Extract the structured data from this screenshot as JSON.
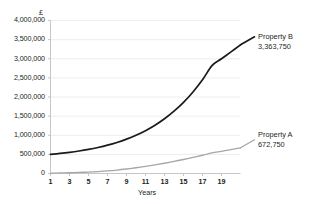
{
  "chart_data": {
    "type": "line",
    "title": "",
    "xlabel": "Years",
    "ylabel": "£",
    "currency_symbol": "£",
    "x": [
      1,
      2,
      3,
      4,
      5,
      6,
      7,
      8,
      9,
      10,
      11,
      12,
      13,
      14,
      15,
      16,
      17,
      18,
      19,
      20,
      21
    ],
    "xtick_labels": [
      "1",
      "3",
      "5",
      "7",
      "9",
      "11",
      "13",
      "15",
      "17",
      "19"
    ],
    "xtick_values": [
      1,
      3,
      5,
      7,
      9,
      11,
      13,
      15,
      17,
      19
    ],
    "xlim": [
      1,
      21
    ],
    "ylim": [
      0,
      4000000
    ],
    "ytick_labels": [
      "0",
      "500,000",
      "1,000,000",
      "1,500,000",
      "2,000,000",
      "2,500,000",
      "3,000,000",
      "3,500,000",
      "4,000,000"
    ],
    "ytick_values": [
      0,
      500000,
      1000000,
      1500000,
      2000000,
      2500000,
      3000000,
      3500000,
      4000000
    ],
    "grid": "horizontal",
    "legend_position": "inline-right-annotations",
    "series": [
      {
        "name": "Property B",
        "end_label": "3,363,750",
        "end_value": 3363750,
        "color": "#1a1a1a",
        "values": [
          500000,
          524000,
          553000,
          588000,
          630000,
          680000,
          740000,
          812000,
          898000,
          1000000,
          1120000,
          1262000,
          1430000,
          1628000,
          1860000,
          2132000,
          2450000,
          2820000,
          3000000,
          3180000,
          3363750
        ]
      },
      {
        "name": "Property A",
        "end_label": "672,750",
        "end_value": 672750,
        "color": "#a6a6a6",
        "values": [
          10000,
          14000,
          20000,
          28000,
          38000,
          51000,
          68000,
          90000,
          118000,
          150000,
          186000,
          225000,
          268000,
          315000,
          366000,
          420000,
          477000,
          537000,
          580000,
          625000,
          672750
        ]
      }
    ],
    "annotations": [
      {
        "series": "Property B",
        "name_text": "Property B",
        "value_text": "3,363,750"
      },
      {
        "series": "Property A",
        "name_text": "Property A",
        "value_text": "672,750"
      }
    ]
  },
  "style": {
    "grid_color": "#e8e8e8",
    "axis_color": "#bfbfbf",
    "text_color": "#231f20",
    "background": "#ffffff"
  }
}
